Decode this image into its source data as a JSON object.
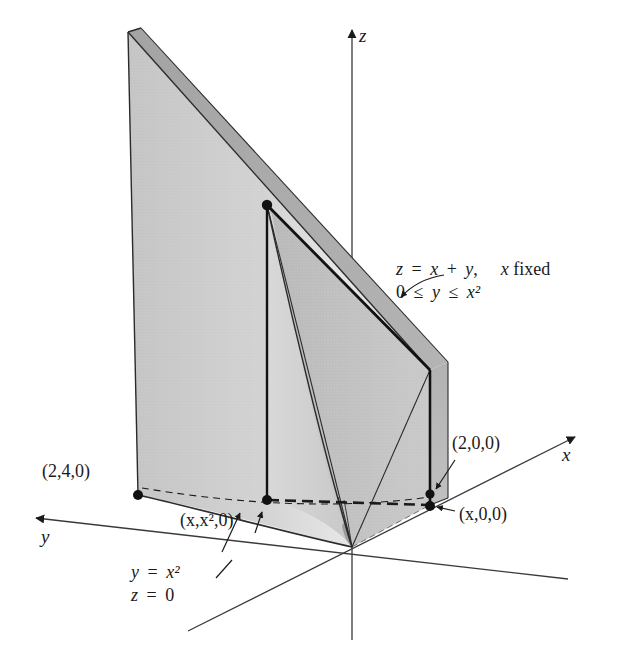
{
  "figure": {
    "kind": "3d-solid-diagram",
    "background_color": "#ffffff",
    "line_color": "#1a1a1a",
    "surface_colors": {
      "front_face_light": "#cfcfcf",
      "front_face_lighter": "#e2e2e2",
      "top_band_medium": "#a9a9a9",
      "right_face": "#b9b9b9",
      "inner_wedge": "#bdbdbd",
      "dark_edge": "#2b2b2b"
    }
  },
  "axes": [
    {
      "name": "z",
      "label": "z",
      "direction": "up"
    },
    {
      "name": "x",
      "label": "x",
      "direction": "upper-right"
    },
    {
      "name": "y",
      "label": "y",
      "direction": "left"
    }
  ],
  "point_labels": [
    {
      "name": "point-2-4-0",
      "text": "(2,4,0)"
    },
    {
      "name": "point-x-x2-0",
      "text": "(x,x²,0)"
    },
    {
      "name": "point-2-0-0",
      "text": "(2,0,0)"
    },
    {
      "name": "point-x-0-0",
      "text": "(x,0,0)"
    }
  ],
  "annotations": {
    "plane": {
      "line1_lhs": "z",
      "line1_rel": "=",
      "line1_rhs_a": "x",
      "line1_op": "+",
      "line1_rhs_b": "y",
      "line1_comma": ",",
      "line1_note_var": "x",
      "line1_note_word": "fixed",
      "line2_lower": "0",
      "line2_rel1": "≤",
      "line2_var": "y",
      "line2_rel2": "≤",
      "line2_upper": "x²",
      "full_text_line1": "z = x + y,   x fixed",
      "full_text_line2": "0 ≤ y ≤ x²"
    },
    "base_curve": {
      "line1_var": "y",
      "line1_rel": "=",
      "line1_expr": "x²",
      "line2_var": "z",
      "line2_rel": "=",
      "line2_expr": "0",
      "full_text_line1": "y = x²",
      "full_text_line2": "z = 0"
    }
  },
  "markers": [
    {
      "name": "dot-top-x",
      "coords": "(x, x², x + x²)"
    },
    {
      "name": "dot-base-x-x2",
      "coords": "(x, x², 0)"
    },
    {
      "name": "dot-base-2-4",
      "coords": "(2, 4, 0)"
    },
    {
      "name": "dot-base-x-0",
      "coords": "(x, 0, 0)"
    },
    {
      "name": "dot-base-2-0",
      "coords": "(2, 0, 0)"
    }
  ]
}
